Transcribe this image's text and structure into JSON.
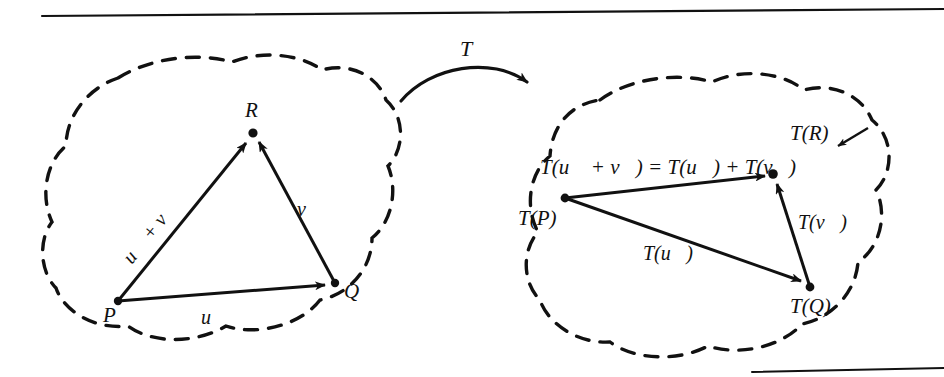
{
  "figure": {
    "kind": "linear-transformation-diagram",
    "caption_rule_top": true,
    "caption_rule_bottom": true,
    "ink_color": "#111111",
    "background_color": "#ffffff"
  },
  "transformation": {
    "arrow_label": "T"
  },
  "domain_cloud": {
    "name": "domain-set",
    "points": [
      {
        "id": "P",
        "label": "P",
        "x": 118,
        "y": 301
      },
      {
        "id": "R",
        "label": "R",
        "x": 253,
        "y": 133
      },
      {
        "id": "Q",
        "label": "Q",
        "x": 335,
        "y": 283
      }
    ],
    "vectors": [
      {
        "id": "u",
        "label": "u⃗",
        "from": "P",
        "to": "Q"
      },
      {
        "id": "v",
        "label": "v⃗",
        "from": "Q",
        "to": "R"
      },
      {
        "id": "u+v",
        "label": "u⃗ + v⃗",
        "from": "P",
        "to": "R"
      }
    ]
  },
  "codomain_cloud": {
    "name": "codomain-set",
    "points": [
      {
        "id": "TP",
        "label": "T(P)",
        "x": 565,
        "y": 198
      },
      {
        "id": "TR",
        "label": "T(R)",
        "x": 773,
        "y": 174
      },
      {
        "id": "TQ",
        "label": "T(Q)",
        "x": 810,
        "y": 287
      }
    ],
    "vectors": [
      {
        "id": "Tu",
        "label": "T(u⃗)",
        "from": "TP",
        "to": "TQ"
      },
      {
        "id": "Tv",
        "label": "T(v⃗)",
        "from": "TQ",
        "to": "TR"
      },
      {
        "id": "Tuv",
        "label": "T(u⃗ + v⃗) = T(u⃗) + T(v⃗)",
        "from": "TP",
        "to": "TR"
      }
    ]
  }
}
